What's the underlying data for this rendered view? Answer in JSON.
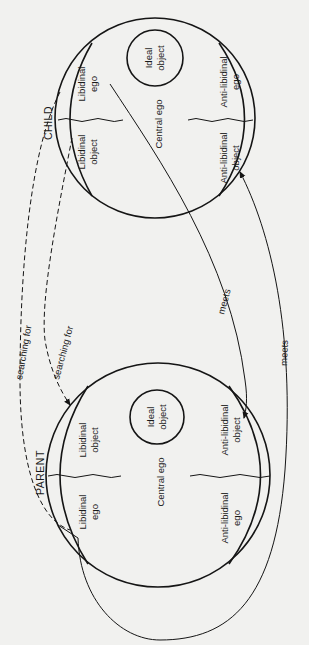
{
  "diagram": {
    "child": {
      "title": "CHILD",
      "libidinal_ego": [
        "Libidinal",
        "ego"
      ],
      "libidinal_object": [
        "Libidinal",
        "object"
      ],
      "central_ego": "Central ego",
      "ideal_object": [
        "Ideal",
        "object"
      ],
      "anti_libidinal_ego": [
        "Anti-libidinal",
        "ego"
      ],
      "anti_libidinal_object": [
        "Anti-libidinal",
        "object"
      ]
    },
    "parent": {
      "title": "PARENT",
      "libidinal_ego": [
        "Libidinal",
        "ego"
      ],
      "libidinal_object": [
        "Libidinal",
        "object"
      ],
      "central_ego": "Central ego",
      "ideal_object": [
        "Ideal",
        "object"
      ],
      "anti_libidinal_ego": [
        "Anti-libidinal",
        "ego"
      ],
      "anti_libidinal_object": [
        "Anti-libidinal",
        "object"
      ]
    },
    "arrows": {
      "searching_for_1": "searching for",
      "searching_for_2": "searching for",
      "meets_1": "meets",
      "meets_2": "meets"
    }
  }
}
